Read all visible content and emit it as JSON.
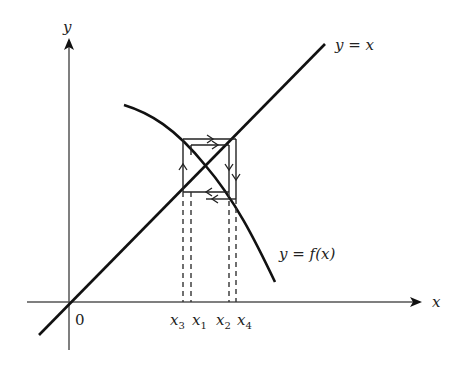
{
  "figure": {
    "axes": {
      "x_label": "x",
      "y_label": "y",
      "origin_label": "0"
    },
    "curves": {
      "identity_label": "y = x",
      "function_label": "y = f(x)"
    },
    "x_ticks": [
      {
        "name": "x",
        "sub": "3"
      },
      {
        "name": "x",
        "sub": "1"
      },
      {
        "name": "x",
        "sub": "2"
      },
      {
        "name": "x",
        "sub": "4"
      }
    ],
    "colors": {
      "line": "#111111",
      "axis": "#555555",
      "dashed": "#333333"
    }
  }
}
